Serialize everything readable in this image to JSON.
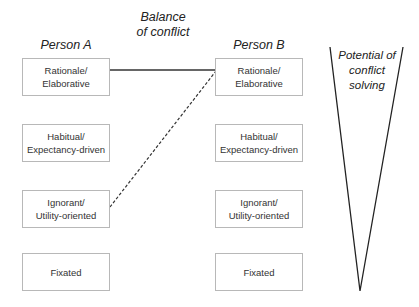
{
  "headings": {
    "person_a": "Person A",
    "person_b": "Person B",
    "balance_line1": "Balance",
    "balance_line2": "of conflict"
  },
  "person_a": {
    "boxes": [
      {
        "line1": "Rationale/",
        "line2": "Elaborative"
      },
      {
        "line1": "Habitual/",
        "line2": "Expectancy-driven"
      },
      {
        "line1": "Ignorant/",
        "line2": "Utility-oriented"
      },
      {
        "line1": "Fixated",
        "line2": ""
      }
    ]
  },
  "person_b": {
    "boxes": [
      {
        "line1": "Rationale/",
        "line2": "Elaborative"
      },
      {
        "line1": "Habitual/",
        "line2": "Expectancy-driven"
      },
      {
        "line1": "Ignorant/",
        "line2": "Utility-oriented"
      },
      {
        "line1": "Fixated",
        "line2": ""
      }
    ]
  },
  "connections": [
    {
      "from": "person_a.Rationale/Elaborative",
      "to": "person_b.Rationale/Elaborative",
      "style": "solid"
    },
    {
      "from": "person_a.Ignorant/Utility-oriented",
      "to": "person_b.Rationale/Elaborative",
      "style": "dashed"
    }
  ],
  "triangle": {
    "line1": "Potential of",
    "line2": "conflict",
    "line3": "solving"
  }
}
